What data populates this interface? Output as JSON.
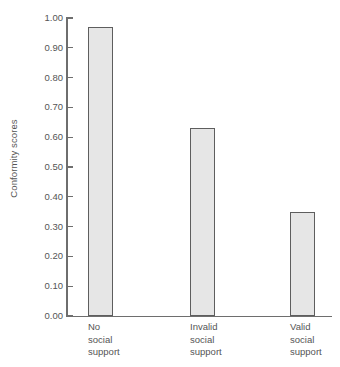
{
  "chart_data": {
    "type": "bar",
    "title": "",
    "xlabel": "",
    "ylabel": "Conformity scores",
    "categories": [
      "No social support",
      "Invalid social support",
      "Valid social support"
    ],
    "category_lines": [
      [
        "No",
        "social",
        "support"
      ],
      [
        "Invalid",
        "social",
        "support"
      ],
      [
        "Valid",
        "social",
        "support"
      ]
    ],
    "values": [
      0.97,
      0.63,
      0.35
    ],
    "ylim": [
      0.0,
      1.0
    ],
    "ytick_values": [
      0.0,
      0.1,
      0.2,
      0.3,
      0.4,
      0.5,
      0.6,
      0.7,
      0.8,
      0.9,
      1.0
    ],
    "ytick_labels": [
      "0.00",
      "0.10",
      "0.20",
      "0.30",
      "0.40",
      "0.50",
      "0.60",
      "0.70",
      "0.80",
      "0.90",
      "1.00"
    ],
    "grid": false,
    "legend": false,
    "bar_fill_color": "#e6e6e6",
    "bar_edge_color": "#5e5e5e",
    "axis_color": "#6e6e6e",
    "background_color": "#ffffff"
  },
  "axis": {
    "y_title": "Conformity scores"
  }
}
